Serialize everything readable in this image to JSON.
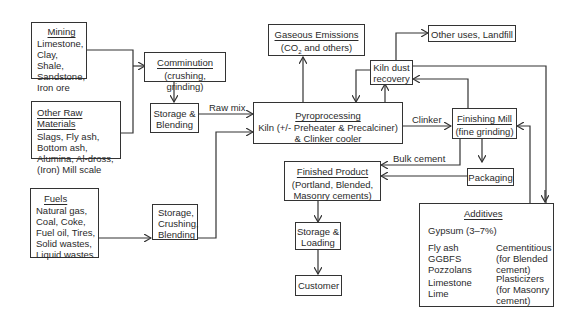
{
  "diagram": {
    "type": "process-flow"
  },
  "nodes": {
    "mining": {
      "title": "Mining",
      "lines": [
        "Limestone,",
        "Clay, Shale,",
        "Sandstone,",
        "Iron ore"
      ]
    },
    "other_raw": {
      "title": "Other Raw Materials",
      "lines": [
        "Slags, Fly ash,",
        "Bottom ash,",
        "Alumina, Al-dross,",
        "(Iron) Mill scale"
      ]
    },
    "fuels": {
      "title": "Fuels",
      "lines": [
        "Natural gas,",
        "Coal, Coke,",
        "Fuel oil, Tires,",
        "Solid wastes,",
        "Liquid wastes"
      ]
    },
    "comminution": {
      "title": "Comminution",
      "sub": "(crushing, grinding)"
    },
    "storage_blending": {
      "lines": [
        "Storage &",
        "Blending"
      ]
    },
    "storage_crushing": {
      "lines": [
        "Storage,",
        "Crushing,",
        "Blending"
      ]
    },
    "pyro": {
      "title": "Pyroprocessing",
      "lines": [
        "Kiln (+/- Preheater & Precalciner)",
        "& Clinker cooler"
      ]
    },
    "emissions": {
      "title": "Gaseous Emissions",
      "sub_pre": "(CO",
      "sub_sub": "2",
      "sub_post": " and others)"
    },
    "kiln_dust": {
      "lines": [
        "Kiln dust",
        "recovery"
      ]
    },
    "other_uses": {
      "label": "Other uses, Landfill"
    },
    "finishing": {
      "title": "Finishing Mill",
      "sub": "(fine grinding)"
    },
    "packaging": {
      "label": "Packaging"
    },
    "finished": {
      "title": "Finished Product",
      "lines": [
        "(Portland, Blended,",
        "Masonry cements)"
      ]
    },
    "storage_loading": {
      "lines": [
        "Storage &",
        "Loading"
      ]
    },
    "customer": {
      "label": "Customer"
    },
    "additives": {
      "title": "Additives",
      "gypsum": "Gypsum (3–7%)",
      "group1": {
        "items": [
          "Fly ash",
          "GGBFS",
          "Pozzolans"
        ],
        "desc": [
          "Cementitious",
          "(for Blended",
          "cement)"
        ]
      },
      "group2": {
        "items": [
          "Limestone",
          "Lime"
        ],
        "desc": [
          "Plasticizers",
          "(for Masonry",
          "cement)"
        ]
      }
    }
  },
  "edge_labels": {
    "raw_mix": "Raw mix",
    "clinker": "Clinker",
    "bulk_cement": "Bulk cement"
  },
  "colors": {
    "line": "#333333",
    "text": "#2a2a2a",
    "background": "#ffffff"
  }
}
